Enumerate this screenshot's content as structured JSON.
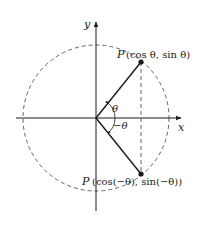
{
  "diagram": {
    "type": "unit-circle-symmetry",
    "axes": {
      "x_label": "x",
      "y_label": "y"
    },
    "angles": {
      "positive_label": "θ",
      "negative_label": "−θ"
    },
    "points": {
      "upper": {
        "name": "P",
        "coords_text": "(cos θ, sin θ)"
      },
      "lower": {
        "name": "P",
        "coords_text": "(cos(−θ), sin(−θ))"
      }
    },
    "colors": {
      "line": "#1a1a1a",
      "dashed": "#555555"
    }
  }
}
